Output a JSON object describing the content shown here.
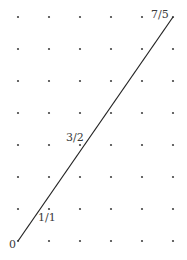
{
  "diagram": {
    "type": "lattice-ray",
    "grid": {
      "columns": 6,
      "rows": 8,
      "x_positions": [
        18,
        49,
        80,
        111,
        142,
        173
      ],
      "y_positions": [
        241,
        209,
        177,
        145,
        113,
        81,
        49,
        17
      ],
      "dot_color": "#444444"
    },
    "ray": {
      "from": [
        0,
        0
      ],
      "to": [
        5,
        7
      ],
      "color": "#222222"
    },
    "labels": [
      {
        "text": "0",
        "lattice": [
          0,
          0
        ],
        "x": 9,
        "y": 248
      },
      {
        "text": "1/1",
        "lattice": [
          1,
          1
        ],
        "x": 38,
        "y": 221
      },
      {
        "text": "3/2",
        "lattice": [
          2,
          3
        ],
        "x": 66,
        "y": 141
      },
      {
        "text": "7/5",
        "lattice": [
          5,
          7
        ],
        "x": 151,
        "y": 18
      }
    ]
  }
}
